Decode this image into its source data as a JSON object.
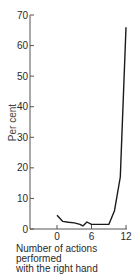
{
  "chart_data": {
    "type": "line",
    "title": "",
    "xlabel": "Number of actions performed with the right hand",
    "xlabel_lines": [
      "Number of actions performed",
      "with the right hand"
    ],
    "ylabel": "Per cent",
    "xlim": [
      0,
      12
    ],
    "ylim": [
      0,
      70
    ],
    "x_ticks": [
      0,
      6,
      12
    ],
    "y_ticks": [
      0,
      10,
      20,
      30,
      40,
      50,
      60,
      70
    ],
    "grid": false,
    "legend": null,
    "series": [
      {
        "name": "Per cent",
        "x": [
          0,
          1,
          2,
          3,
          4,
          4.5,
          5.2,
          6,
          7,
          8,
          9,
          10,
          11,
          12
        ],
        "y": [
          4.5,
          2.5,
          2.2,
          2.0,
          1.5,
          1.0,
          2.3,
          1.5,
          1.5,
          1.5,
          1.5,
          6,
          17,
          66
        ]
      }
    ],
    "colors": {
      "line": "#1a1a1a",
      "axis": "#555555",
      "text": "#2a2a2a"
    }
  }
}
